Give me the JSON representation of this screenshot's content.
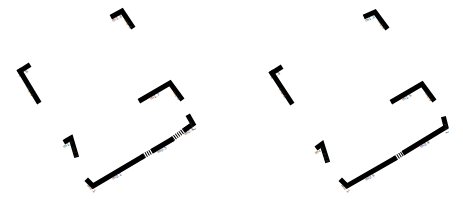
{
  "diagram": {
    "type": "floor-plan-wall-segments",
    "panels": [
      {
        "id": "left",
        "walls": [
          {
            "points": [
              [
                113,
                16
              ],
              [
                122,
                11
              ],
              [
                132,
                26
              ]
            ],
            "labels": [
              "m1.3",
              "m2.6"
            ]
          },
          {
            "points": [
              [
                20,
                71
              ],
              [
                28,
                66
              ]
            ],
            "labels": [
              "m1.6"
            ]
          },
          {
            "points": [
              [
                20,
                71
              ],
              [
                38,
                101
              ]
            ],
            "labels": [
              "m2.6"
            ]
          },
          {
            "points": [
              [
                141,
                100
              ],
              [
                170,
                83
              ],
              [
                181,
                98
              ]
            ],
            "labels": [
              "m1.7",
              "m2.8"
            ]
          },
          {
            "points": [
              [
                66,
                141
              ],
              [
                71,
                138
              ],
              [
                76,
                155
              ]
            ],
            "labels": [
              "m1.5",
              "m2.5"
            ]
          },
          {
            "points": [
              [
                88,
                181
              ],
              [
                93,
                186
              ],
              [
                142,
                157
              ]
            ],
            "labels": [
              "m2.1",
              "m0.1"
            ]
          },
          {
            "points": [
              [
                154,
                150
              ],
              [
                171,
                140
              ]
            ],
            "labels": [
              "m0.5"
            ]
          },
          {
            "points": [
              [
                186,
                129
              ],
              [
                193,
                124
              ],
              [
                189,
                117
              ]
            ],
            "labels": [
              "m2.1",
              "m0.2"
            ]
          }
        ],
        "glass_segments": [
          {
            "points": [
              [
                142,
                157
              ],
              [
                154,
                150
              ]
            ]
          },
          {
            "points": [
              [
                171,
                140
              ],
              [
                186,
                129
              ]
            ]
          }
        ]
      },
      {
        "id": "right",
        "walls": [
          {
            "points": [
              [
                366,
                16
              ],
              [
                375,
                12
              ],
              [
                386,
                27
              ]
            ],
            "labels": [
              "m1.3",
              "m2.6"
            ]
          },
          {
            "points": [
              [
                272,
                73
              ],
              [
                280,
                68
              ]
            ],
            "labels": [
              "m1.3"
            ]
          },
          {
            "points": [
              [
                272,
                73
              ],
              [
                291,
                102
              ]
            ],
            "labels": [
              "m2.6"
            ]
          },
          {
            "points": [
              [
                393,
                101
              ],
              [
                422,
                84
              ],
              [
                433,
                99
              ]
            ],
            "labels": [
              "m1.5",
              "m2.3"
            ]
          },
          {
            "points": [
              [
                318,
                147
              ],
              [
                322,
                144
              ],
              [
                327,
                160
              ]
            ],
            "labels": [
              "m1.5",
              "m2.6"
            ]
          },
          {
            "points": [
              [
                342,
                181
              ],
              [
                347,
                186
              ],
              [
                394,
                159
              ]
            ],
            "labels": [
              "m2.1",
              "m0.5"
            ]
          },
          {
            "points": [
              [
                405,
                152
              ],
              [
                446,
                127
              ],
              [
                444,
                119
              ]
            ],
            "labels": [
              "m0.4",
              "m2.1"
            ]
          }
        ],
        "glass_segments": [
          {
            "points": [
              [
                394,
                159
              ],
              [
                405,
                152
              ]
            ]
          }
        ]
      }
    ]
  }
}
